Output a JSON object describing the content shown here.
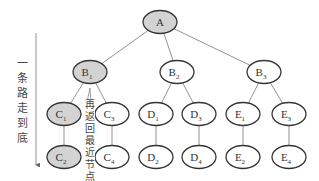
{
  "diagram": {
    "type": "tree",
    "left_label": "一条路走到底",
    "backtrack_label": "再返回最近节点",
    "visited_color": "#d3d3d3",
    "nodes": [
      {
        "id": "A",
        "base": "A",
        "sub": "",
        "x": 160,
        "y": 22,
        "visited": true
      },
      {
        "id": "B1",
        "base": "B",
        "sub": "1",
        "x": 90,
        "y": 72,
        "visited": true
      },
      {
        "id": "B2",
        "base": "B",
        "sub": "2",
        "x": 177,
        "y": 72,
        "visited": false
      },
      {
        "id": "B3",
        "base": "B",
        "sub": "3",
        "x": 264,
        "y": 72,
        "visited": false
      },
      {
        "id": "C1",
        "base": "C",
        "sub": "1",
        "x": 64,
        "y": 114,
        "visited": true
      },
      {
        "id": "C3",
        "base": "C",
        "sub": "3",
        "x": 112,
        "y": 114,
        "visited": false
      },
      {
        "id": "D1",
        "base": "D",
        "sub": "1",
        "x": 156,
        "y": 114,
        "visited": false
      },
      {
        "id": "D3",
        "base": "D",
        "sub": "3",
        "x": 199,
        "y": 114,
        "visited": false
      },
      {
        "id": "E1",
        "base": "E",
        "sub": "1",
        "x": 243,
        "y": 114,
        "visited": false
      },
      {
        "id": "E3",
        "base": "E",
        "sub": "3",
        "x": 289,
        "y": 114,
        "visited": false
      },
      {
        "id": "C2",
        "base": "C",
        "sub": "2",
        "x": 64,
        "y": 157,
        "visited": true
      },
      {
        "id": "C4",
        "base": "C",
        "sub": "4",
        "x": 112,
        "y": 157,
        "visited": false
      },
      {
        "id": "D2",
        "base": "D",
        "sub": "2",
        "x": 156,
        "y": 157,
        "visited": false
      },
      {
        "id": "D4",
        "base": "D",
        "sub": "4",
        "x": 199,
        "y": 157,
        "visited": false
      },
      {
        "id": "E2",
        "base": "E",
        "sub": "2",
        "x": 243,
        "y": 157,
        "visited": false
      },
      {
        "id": "E4",
        "base": "E",
        "sub": "4",
        "x": 289,
        "y": 157,
        "visited": false
      }
    ],
    "edges": [
      [
        "A",
        "B1"
      ],
      [
        "A",
        "B2"
      ],
      [
        "A",
        "B3"
      ],
      [
        "B1",
        "C1"
      ],
      [
        "B1",
        "C3"
      ],
      [
        "B2",
        "D1"
      ],
      [
        "B2",
        "D3"
      ],
      [
        "B3",
        "E1"
      ],
      [
        "B3",
        "E3"
      ],
      [
        "C1",
        "C2"
      ],
      [
        "C3",
        "C4"
      ],
      [
        "D1",
        "D2"
      ],
      [
        "D3",
        "D4"
      ],
      [
        "E1",
        "E2"
      ],
      [
        "E3",
        "E4"
      ]
    ]
  }
}
